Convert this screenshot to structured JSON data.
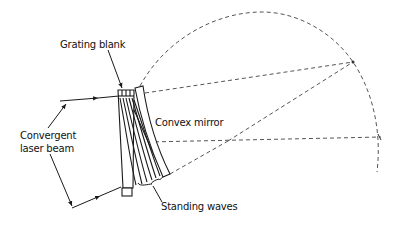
{
  "diagram": {
    "labels": {
      "grating_blank": "Grating blank",
      "convergent_line1": "Convergent",
      "convergent_line2": "laser beam",
      "convex_mirror": "Convex mirror",
      "standing_waves": "Standing waves"
    },
    "colors": {
      "line": "#1a1a1a",
      "dashed": "#555555",
      "background": "#ffffff"
    }
  }
}
